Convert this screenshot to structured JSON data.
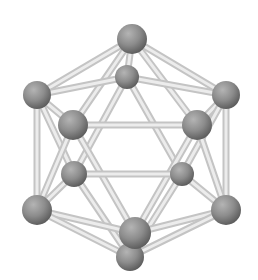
{
  "figure": {
    "background": "#ffffff",
    "atom_color": "#8a8a8a",
    "bond_color": "#d8d8d8",
    "atoms": [
      {
        "id": "top",
        "x": 132,
        "y": 39,
        "r": 15
      },
      {
        "id": "upper-back",
        "x": 127,
        "y": 77,
        "r": 12
      },
      {
        "id": "upper-left",
        "x": 37,
        "y": 95,
        "r": 14
      },
      {
        "id": "upper-right",
        "x": 226,
        "y": 95,
        "r": 14
      },
      {
        "id": "front-upper-left",
        "x": 73,
        "y": 125,
        "r": 15
      },
      {
        "id": "front-upper-right",
        "x": 197,
        "y": 125,
        "r": 15
      },
      {
        "id": "lower-back-left",
        "x": 74,
        "y": 174,
        "r": 13
      },
      {
        "id": "lower-back-right",
        "x": 182,
        "y": 174,
        "r": 12
      },
      {
        "id": "lower-left",
        "x": 37,
        "y": 210,
        "r": 15
      },
      {
        "id": "lower-right",
        "x": 226,
        "y": 210,
        "r": 15
      },
      {
        "id": "bottom-front",
        "x": 135,
        "y": 233,
        "r": 16
      },
      {
        "id": "bottom",
        "x": 130,
        "y": 257,
        "r": 14
      }
    ],
    "bonds": [
      [
        "top",
        "upper-back"
      ],
      [
        "top",
        "upper-left"
      ],
      [
        "top",
        "upper-right"
      ],
      [
        "top",
        "front-upper-left"
      ],
      [
        "top",
        "front-upper-right"
      ],
      [
        "upper-back",
        "upper-left"
      ],
      [
        "upper-back",
        "upper-right"
      ],
      [
        "upper-back",
        "lower-back-left"
      ],
      [
        "upper-back",
        "lower-back-right"
      ],
      [
        "upper-left",
        "front-upper-left"
      ],
      [
        "upper-left",
        "lower-left"
      ],
      [
        "upper-left",
        "lower-back-left"
      ],
      [
        "upper-right",
        "front-upper-right"
      ],
      [
        "upper-right",
        "lower-right"
      ],
      [
        "upper-right",
        "lower-back-right"
      ],
      [
        "front-upper-left",
        "front-upper-right"
      ],
      [
        "front-upper-left",
        "lower-left"
      ],
      [
        "front-upper-left",
        "bottom-front"
      ],
      [
        "front-upper-right",
        "lower-right"
      ],
      [
        "front-upper-right",
        "bottom-front"
      ],
      [
        "lower-back-left",
        "lower-back-right"
      ],
      [
        "lower-back-left",
        "lower-left"
      ],
      [
        "lower-back-left",
        "bottom"
      ],
      [
        "lower-back-right",
        "lower-right"
      ],
      [
        "lower-back-right",
        "bottom"
      ],
      [
        "lower-left",
        "bottom-front"
      ],
      [
        "lower-left",
        "bottom"
      ],
      [
        "lower-right",
        "bottom-front"
      ],
      [
        "lower-right",
        "bottom"
      ],
      [
        "bottom-front",
        "bottom"
      ]
    ]
  }
}
